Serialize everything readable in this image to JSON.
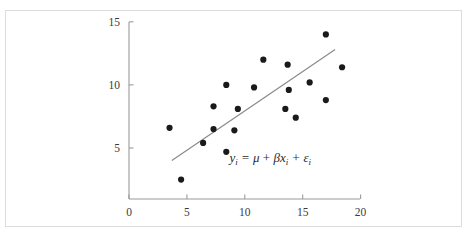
{
  "chart_data": {
    "type": "scatter",
    "title": "",
    "subtitle": "",
    "xlabel": "",
    "ylabel": "",
    "xlim": [
      0,
      20
    ],
    "ylim": [
      0,
      15
    ],
    "grid": false,
    "legend": null,
    "x_ticks": [
      "0",
      "5",
      "10",
      "15",
      "20"
    ],
    "x_tick_values": [
      0,
      5,
      10,
      15,
      20
    ],
    "y_ticks": [
      "5",
      "10",
      "15"
    ],
    "y_tick_values": [
      5,
      10,
      15
    ],
    "points": [
      {
        "x": 3.5,
        "y": 6.6
      },
      {
        "x": 4.5,
        "y": 2.5
      },
      {
        "x": 6.4,
        "y": 5.4
      },
      {
        "x": 7.3,
        "y": 8.3
      },
      {
        "x": 7.3,
        "y": 6.5
      },
      {
        "x": 8.4,
        "y": 10.0
      },
      {
        "x": 8.4,
        "y": 4.7
      },
      {
        "x": 9.1,
        "y": 6.4
      },
      {
        "x": 9.4,
        "y": 8.1
      },
      {
        "x": 10.8,
        "y": 9.8
      },
      {
        "x": 11.6,
        "y": 12.0
      },
      {
        "x": 13.5,
        "y": 8.1
      },
      {
        "x": 13.7,
        "y": 11.6
      },
      {
        "x": 13.8,
        "y": 9.6
      },
      {
        "x": 14.4,
        "y": 7.4
      },
      {
        "x": 15.6,
        "y": 10.2
      },
      {
        "x": 17.0,
        "y": 14.0
      },
      {
        "x": 17.0,
        "y": 8.8
      },
      {
        "x": 18.4,
        "y": 11.4
      }
    ],
    "fit_line": {
      "x_start": 3.7,
      "y_start": 4.0,
      "x_end": 17.8,
      "y_end": 12.8,
      "color": "#8a8a8a"
    },
    "annotation": {
      "label": "y_i = μ + βx_i + ε_i",
      "x": 12.2,
      "y": 3.9,
      "parts": {
        "y": "y",
        "sub_i_1": "i",
        "equals": " = ",
        "mu": "μ",
        "plus1": " + ",
        "beta": "β",
        "x": "x",
        "sub_i_2": "i",
        "plus2": " + ",
        "epsilon": "ε",
        "sub_i_3": "i"
      }
    },
    "colors": {
      "point": "#1a1a1a",
      "axis": "#9a9a9a",
      "line": "#8a8a8a",
      "frame": "#dcdcdc",
      "background": "#ffffff",
      "tick_label": "#3a3a3a"
    }
  }
}
